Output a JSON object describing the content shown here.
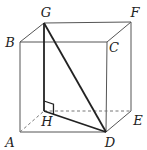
{
  "figure": {
    "colors": {
      "edge": "#555555",
      "bold": "#222222",
      "hidden": "#777777",
      "label": "#222222"
    }
  },
  "vertices": {
    "A": {
      "label": "A",
      "x": 20,
      "y": 132,
      "lx": 10,
      "ly": 142
    },
    "B": {
      "label": "B",
      "x": 20,
      "y": 42,
      "lx": 10,
      "ly": 42
    },
    "C": {
      "label": "C",
      "x": 107,
      "y": 42,
      "lx": 114,
      "ly": 47
    },
    "D": {
      "label": "D",
      "x": 106,
      "y": 132,
      "lx": 110,
      "ly": 142
    },
    "E": {
      "label": "E",
      "x": 131,
      "y": 111,
      "lx": 138,
      "ly": 120
    },
    "F": {
      "label": "F",
      "x": 131,
      "y": 22,
      "lx": 135,
      "ly": 12
    },
    "G": {
      "label": "G",
      "x": 44,
      "y": 23,
      "lx": 46,
      "ly": 12
    },
    "H": {
      "label": "H",
      "x": 44,
      "y": 111,
      "lx": 47,
      "ly": 121
    }
  },
  "edges": {
    "solid": [
      [
        "A",
        "B"
      ],
      [
        "B",
        "C"
      ],
      [
        "C",
        "D"
      ],
      [
        "A",
        "D"
      ],
      [
        "B",
        "G"
      ],
      [
        "G",
        "F"
      ],
      [
        "C",
        "F"
      ],
      [
        "F",
        "E"
      ],
      [
        "D",
        "E"
      ]
    ],
    "dashed": [
      [
        "A",
        "H"
      ],
      [
        "H",
        "E"
      ]
    ],
    "bold": [
      [
        "G",
        "H"
      ],
      [
        "G",
        "D"
      ],
      [
        "H",
        "D"
      ]
    ]
  },
  "right_angle_mark": {
    "at": "H",
    "size": 10
  }
}
